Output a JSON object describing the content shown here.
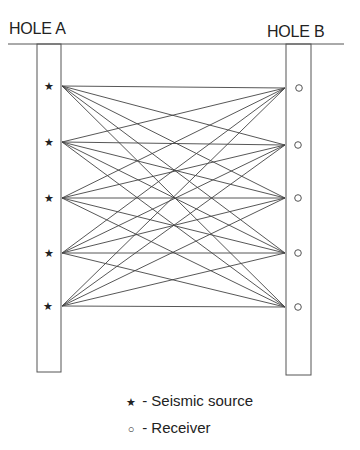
{
  "labels": {
    "hole_a": "HOLE A",
    "hole_b": "HOLE B"
  },
  "legend": {
    "source_symbol": "★",
    "source_text": " - Seismic source",
    "receiver_symbol": "○",
    "receiver_text": " - Receiver"
  },
  "geometry": {
    "ground": {
      "x1": 8,
      "x2": 344,
      "y": 44
    },
    "hole_a": {
      "x": 37,
      "y": 44,
      "w": 24,
      "bottom": 372
    },
    "hole_b": {
      "x": 286,
      "y": 44,
      "w": 25,
      "bottom": 375
    },
    "sources": [
      {
        "x": 49,
        "y": 86
      },
      {
        "x": 49,
        "y": 142
      },
      {
        "x": 49,
        "y": 198
      },
      {
        "x": 49,
        "y": 253
      },
      {
        "x": 48,
        "y": 306
      }
    ],
    "receivers": [
      {
        "x": 299,
        "y": 88
      },
      {
        "x": 298,
        "y": 145
      },
      {
        "x": 298,
        "y": 198
      },
      {
        "x": 298,
        "y": 253
      },
      {
        "x": 298,
        "y": 307
      }
    ],
    "ray_start_x": 62,
    "ray_end_x": 285
  },
  "colors": {
    "line": "#555555",
    "ray": "#444444",
    "text": "#222222"
  }
}
